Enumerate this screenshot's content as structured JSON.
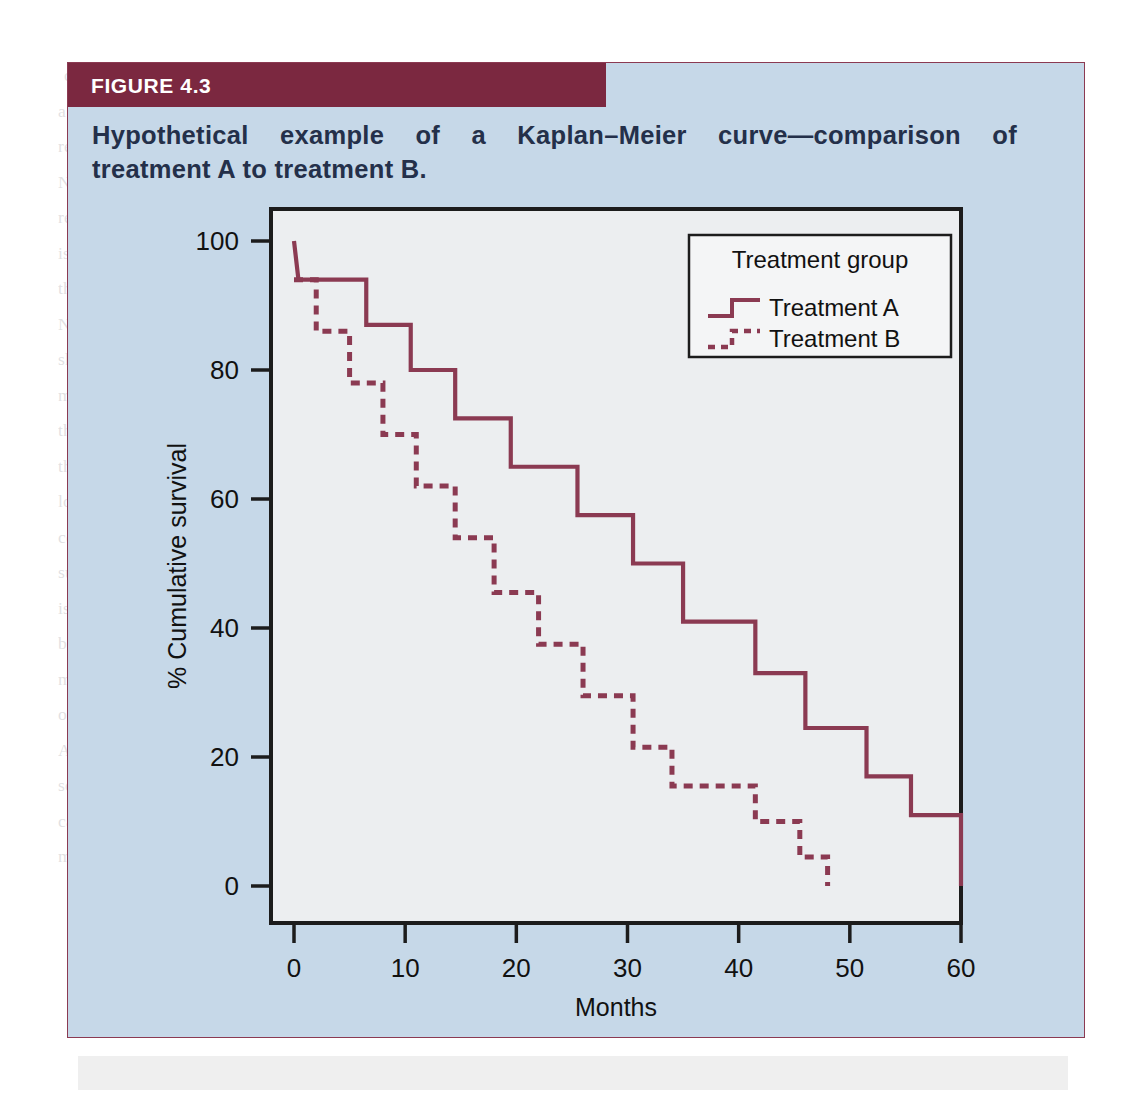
{
  "figure": {
    "number_label": "FIGURE 4.3",
    "caption_line1": "Hypothetical example of a Kaplan–Meier curve—comparison of",
    "caption_line2": "treatment A to treatment B.",
    "header_color": "#7b2840",
    "panel_color": "#c6d8e8",
    "curve_color": "#8b3a52"
  },
  "legend": {
    "title": "Treatment group",
    "items": [
      {
        "label": "Treatment A",
        "style": "solid"
      },
      {
        "label": "Treatment B",
        "style": "dashed"
      }
    ]
  },
  "chart_data": {
    "type": "line",
    "subtype": "kaplan-meier-step",
    "title": "",
    "xlabel": "Months",
    "ylabel": "% Cumulative survival",
    "xlim": [
      0,
      62
    ],
    "ylim": [
      0,
      103
    ],
    "xticks": [
      0,
      10,
      20,
      30,
      40,
      50,
      60
    ],
    "xticklabels": [
      "0",
      "10",
      "20",
      "30",
      "40",
      "50",
      "60"
    ],
    "yticks": [
      0,
      20,
      40,
      60,
      80,
      100
    ],
    "yticklabels": [
      "0",
      "20",
      "40",
      "60",
      "80",
      "100"
    ],
    "grid": false,
    "legend_position": "top-right",
    "series": [
      {
        "name": "Treatment A",
        "style": "solid",
        "color": "#8b3a52",
        "points": [
          {
            "x": 0,
            "y": 100
          },
          {
            "x": 0.4,
            "y": 94
          },
          {
            "x": 6.5,
            "y": 94
          },
          {
            "x": 6.5,
            "y": 87
          },
          {
            "x": 10.5,
            "y": 87
          },
          {
            "x": 10.5,
            "y": 80
          },
          {
            "x": 14.5,
            "y": 80
          },
          {
            "x": 14.5,
            "y": 72.5
          },
          {
            "x": 19.5,
            "y": 72.5
          },
          {
            "x": 19.5,
            "y": 65
          },
          {
            "x": 25.5,
            "y": 65
          },
          {
            "x": 25.5,
            "y": 57.5
          },
          {
            "x": 30.5,
            "y": 57.5
          },
          {
            "x": 30.5,
            "y": 50
          },
          {
            "x": 35,
            "y": 50
          },
          {
            "x": 35,
            "y": 41
          },
          {
            "x": 41.5,
            "y": 41
          },
          {
            "x": 41.5,
            "y": 33
          },
          {
            "x": 46,
            "y": 33
          },
          {
            "x": 46,
            "y": 24.5
          },
          {
            "x": 51.5,
            "y": 24.5
          },
          {
            "x": 51.5,
            "y": 17
          },
          {
            "x": 55.5,
            "y": 17
          },
          {
            "x": 55.5,
            "y": 11
          },
          {
            "x": 60,
            "y": 11
          },
          {
            "x": 60,
            "y": 0
          }
        ]
      },
      {
        "name": "Treatment B",
        "style": "dashed",
        "color": "#8b3a52",
        "points": [
          {
            "x": 0,
            "y": 94
          },
          {
            "x": 2,
            "y": 94
          },
          {
            "x": 2,
            "y": 86
          },
          {
            "x": 5,
            "y": 86
          },
          {
            "x": 5,
            "y": 78
          },
          {
            "x": 8,
            "y": 78
          },
          {
            "x": 8,
            "y": 70
          },
          {
            "x": 11,
            "y": 70
          },
          {
            "x": 11,
            "y": 62
          },
          {
            "x": 14.5,
            "y": 62
          },
          {
            "x": 14.5,
            "y": 54
          },
          {
            "x": 18,
            "y": 54
          },
          {
            "x": 18,
            "y": 45.5
          },
          {
            "x": 22,
            "y": 45.5
          },
          {
            "x": 22,
            "y": 37.5
          },
          {
            "x": 26,
            "y": 37.5
          },
          {
            "x": 26,
            "y": 29.5
          },
          {
            "x": 30.5,
            "y": 29.5
          },
          {
            "x": 30.5,
            "y": 21.5
          },
          {
            "x": 34,
            "y": 21.5
          },
          {
            "x": 34,
            "y": 15.5
          },
          {
            "x": 41.5,
            "y": 15.5
          },
          {
            "x": 41.5,
            "y": 10
          },
          {
            "x": 45.5,
            "y": 10
          },
          {
            "x": 45.5,
            "y": 4.5
          },
          {
            "x": 48,
            "y": 4.5
          },
          {
            "x": 48,
            "y": 0
          }
        ]
      }
    ]
  },
  "bleed_text": {
    "lines": [
      "condition or negative consequence of a treatment.",
      "a population to reduce the incidence of a disease or the number of individuals affected by",
      "recurrence of a condition. The efficacy of a treatment or therapy shown by RRR, ARR, and",
      "NNT is illustrated in Table 14.1. NNT is the number of patients required to be treated to",
      "recover one patient and is based on ARR and the inverse of it. The benefit of a treatment",
      "is an absolute measure of treatments. However, the ARR often has a false account and",
      "these patients being treated rating the different risk with considering the population. The",
      "NNT, on the other hand, gives the number of those with a disease in a given amount",
      "should an event will be prevented by the treatment. Similarly, the NNT for the treat-",
      "ment of the in the whole population among everyone, the event will be prevented by",
      "the intervention (Hely et al., Dobson, 2004). It should be kept in mind that in case of",
      "the NNT, which measures patient mortality, and the products of intervention, even that",
      "loss saved (e.g. early death (e.g. tobacco with alcohol)). Information on NNT helps to",
      "compare the importance of primary prevention initiatives designed to reduce risk factors",
      "such as obesity and other risk factors such as smoking. Such of this is a measure that",
      "is helpful in determining the benefits/risks of new interventions or treatments.",
      "be likely the DALY and the NNT provide a better population-based measure, which",
      "ment to measure on individual and the population as a whole. (See Table 14.1 for a list",
      "of these measures.)",
      "A requirement for the NNT who is involved in population-based studies is to have a",
      "sound outcome concept. More extensive information on the formulas and examples that",
      "can can be developed as the efficacy of treatment in terms of individual outcomes known as",
      "measure of population health and the health of population as a whole."
    ]
  }
}
